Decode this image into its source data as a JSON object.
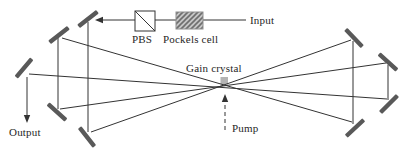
{
  "diagram": {
    "type": "optical-multipass-amplifier-schematic",
    "labels": {
      "input": "Input",
      "pbs": "PBS",
      "pockels_cell": "Pockels cell",
      "gain_crystal": "Gain crystal",
      "pump": "Pump",
      "output": "Output"
    },
    "colors": {
      "background": "#ffffff",
      "beam": "#333333",
      "mirror": "#595959",
      "hatch": "#6e6e6e",
      "component_fill": "#c6c6c6",
      "crystal_fill": "#b3b3b3",
      "text": "#262626"
    }
  }
}
